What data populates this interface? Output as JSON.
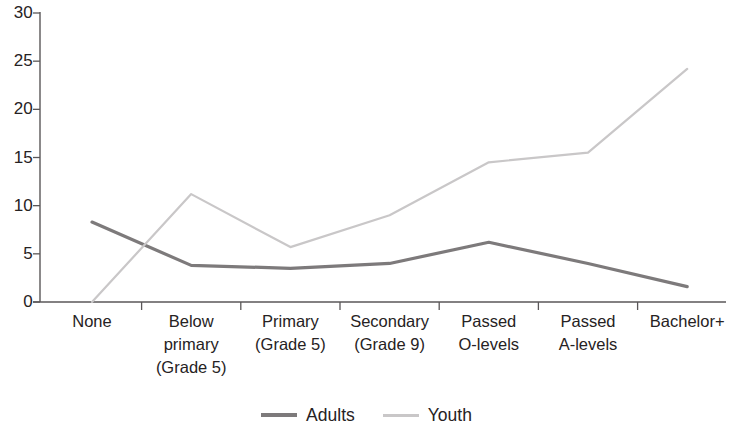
{
  "chart_data": {
    "type": "line",
    "title": "",
    "subtitle": "",
    "xlabel": "",
    "ylabel": "",
    "ylim": [
      0,
      30
    ],
    "yticks": [
      0,
      5,
      10,
      15,
      20,
      25,
      30
    ],
    "ytick_labels": [
      "0",
      "5",
      "10",
      "15",
      "20",
      "25",
      "30"
    ],
    "grid": false,
    "legend_position": "bottom-center",
    "categories": [
      "None",
      "Below\nprimary\n(Grade 5)",
      "Primary\n(Grade 5)",
      "Secondary\n(Grade 9)",
      "Passed\nO-levels",
      "Passed\nA-levels",
      "Bachelor+"
    ],
    "series": [
      {
        "name": "Adults",
        "color": "#7d7a7b",
        "values": [
          8.3,
          3.8,
          3.5,
          4.0,
          6.2,
          4.0,
          1.6
        ]
      },
      {
        "name": "Youth",
        "color": "#c9c7c8",
        "values": [
          0.0,
          11.2,
          5.7,
          9.0,
          14.5,
          15.5,
          24.2
        ]
      }
    ]
  },
  "axis": {
    "line_color": "#5a5758"
  },
  "legend": {
    "items": [
      {
        "label": "Adults",
        "color": "#7d7a7b"
      },
      {
        "label": "Youth",
        "color": "#c9c7c8"
      }
    ]
  }
}
